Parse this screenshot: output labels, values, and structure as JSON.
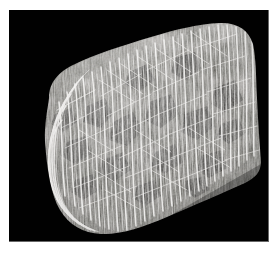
{
  "figure": {
    "domain": "Natural-Image",
    "kind": "scientific-micrograph",
    "modality": "grayscale scanning electron / micro-CT style render",
    "caption": "",
    "has_text_labels": false,
    "has_scale_bar": false
  },
  "canvas": {
    "width": 279,
    "height": 253,
    "page_background": "#ffffff",
    "panel_background": "#010101",
    "panel": {
      "x": 9,
      "y": 10,
      "width": 260,
      "height": 232
    }
  },
  "palette": {
    "background_black": "#010101",
    "page_white": "#ffffff",
    "panel_hairline": "#bebebe",
    "strut_bright": "#f2f1ef",
    "strut_mid": "#bdbab6",
    "matrix_mid_gray": "#8d8a86",
    "matrix_dark_gray": "#4a4845",
    "pore_dark": "#242321",
    "pore_darkest": "#121211"
  },
  "specimen": {
    "name": "bone-specimen",
    "description": "Wedge / loaf shaped block occupying most of the panel, rounded on the left, ridged along the top, cut away diagonally at the lower right.",
    "bounds": {
      "x": 12,
      "y": 12,
      "width": 240,
      "height": 210
    },
    "outline_points": "40,86 48,70 62,58 84,48 112,38 142,28 172,20 196,15 214,14 232,18 243,30 246,52 248,84 250,118 252,148 250,166 236,174 206,186 176,198 150,210 124,220 102,224 80,222 62,214 48,198 40,176 36,148 35,120",
    "features": [
      {
        "name": "rounded-left-lobe",
        "note": "smooth convex bulge at mid-left"
      },
      {
        "name": "ridged-top-margin",
        "note": "jagged crest rising left to right"
      },
      {
        "name": "diagonal-lower-right-cut",
        "note": "straight fractured face"
      },
      {
        "name": "stepped-bottom-edge",
        "note": "stair-stepped lower boundary"
      }
    ]
  },
  "microstructure": {
    "type": "open-cell trabecular lattice",
    "strut_orientation": "predominantly vertical / steeply inclined columns with oblique cross-ties",
    "approx_strut_count": 420,
    "approx_pore_count": 95,
    "pore_shape": "irregular polygonal",
    "illumination": "flat frontal, no cast shadow, brighter toward the upper ridge"
  }
}
